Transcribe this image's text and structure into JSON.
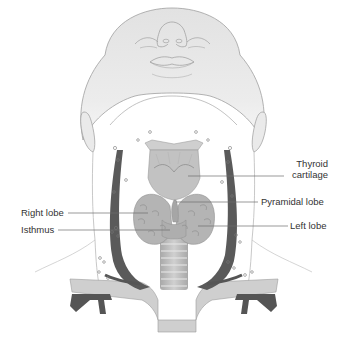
{
  "diagram": {
    "labels": {
      "thyroid_cartilage_line1": "Thyroid",
      "thyroid_cartilage_line2": "cartilage",
      "pyramidal_lobe": "Pyramidal lobe",
      "left_lobe": "Left lobe",
      "right_lobe": "Right lobe",
      "isthmus": "Isthmus"
    },
    "colors": {
      "skin": "#e6e6e6",
      "outline": "#9a9a9a",
      "vessel": "#555555",
      "gland": "#b5b5b5",
      "cartilage": "#c4c4c4",
      "trachea": "#bdbdbd",
      "label_line": "#6e6e6e",
      "text": "#333333"
    }
  }
}
